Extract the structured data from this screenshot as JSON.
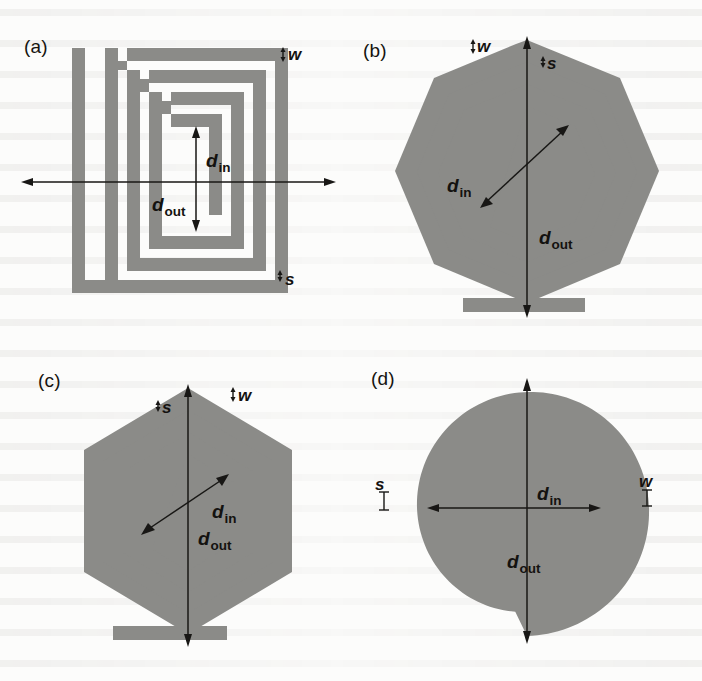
{
  "figure": {
    "trace_color": "#8b8b88",
    "line_color": "#181715",
    "background_color": "#fcfcfb"
  },
  "symbols": {
    "d_letter": "d",
    "in_sub": "in",
    "out_sub": "out",
    "w": "w",
    "s": "s"
  },
  "panels": [
    {
      "id": "a",
      "label": "(a)",
      "shape": "square",
      "turns": 2.75,
      "annotations": [
        {
          "name": "d-in",
          "letter": "d",
          "sub": "in",
          "orientation": "vertical",
          "arrow": "double"
        },
        {
          "name": "d-out",
          "letter": "d",
          "sub": "out",
          "orientation": "horizontal",
          "arrow": "double"
        },
        {
          "name": "w",
          "letter": "w",
          "orientation": "vertical-tick"
        },
        {
          "name": "s",
          "letter": "s",
          "orientation": "vertical-tick"
        }
      ]
    },
    {
      "id": "b",
      "label": "(b)",
      "shape": "octagon",
      "turns": 2.75,
      "annotations": [
        {
          "name": "d-in",
          "letter": "d",
          "sub": "in",
          "orientation": "diagonal",
          "arrow": "double"
        },
        {
          "name": "d-out",
          "letter": "d",
          "sub": "out",
          "orientation": "vertical",
          "arrow": "double"
        },
        {
          "name": "w",
          "letter": "w",
          "orientation": "vertical-tick"
        },
        {
          "name": "s",
          "letter": "s",
          "orientation": "vertical-tick"
        }
      ]
    },
    {
      "id": "c",
      "label": "(c)",
      "shape": "hexagon",
      "turns": 2.75,
      "annotations": [
        {
          "name": "d-in",
          "letter": "d",
          "sub": "in",
          "orientation": "diagonal",
          "arrow": "double"
        },
        {
          "name": "d-out",
          "letter": "d",
          "sub": "out",
          "orientation": "vertical",
          "arrow": "double"
        },
        {
          "name": "w",
          "letter": "w",
          "orientation": "vertical-tick"
        },
        {
          "name": "s",
          "letter": "s",
          "orientation": "vertical-tick"
        }
      ]
    },
    {
      "id": "d",
      "label": "(d)",
      "shape": "circle",
      "turns": 2.75,
      "annotations": [
        {
          "name": "d-in",
          "letter": "d",
          "sub": "in",
          "orientation": "horizontal",
          "arrow": "double"
        },
        {
          "name": "d-out",
          "letter": "d",
          "sub": "out",
          "orientation": "vertical",
          "arrow": "double"
        },
        {
          "name": "w",
          "letter": "w",
          "orientation": "vertical-tick"
        },
        {
          "name": "s",
          "letter": "s",
          "orientation": "vertical-tick"
        }
      ]
    }
  ]
}
